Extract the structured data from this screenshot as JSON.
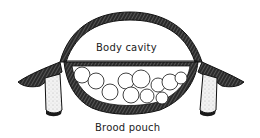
{
  "figure": {
    "type": "cross-section line drawing",
    "labels": {
      "body_cavity": "Body cavity",
      "brood_pouch": "Brood pouch"
    },
    "egg_count": 11,
    "colors": {
      "ink": "#1a1a1a",
      "paper": "#ffffff",
      "hatch": "#555555"
    }
  }
}
